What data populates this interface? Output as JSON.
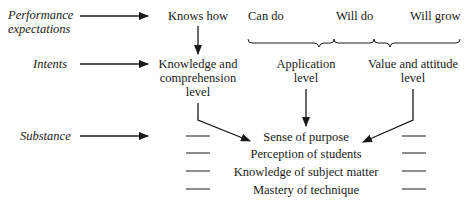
{
  "rows": {
    "performance": {
      "label_line1": "Performance",
      "label_line2": "expectations"
    },
    "intents": {
      "label": "Intents"
    },
    "substance": {
      "label": "Substance"
    }
  },
  "expectations": {
    "knows_how": "Knows how",
    "can_do": "Can do",
    "will_do": "Will do",
    "will_grow": "Will grow"
  },
  "intent_levels": {
    "knowledge": {
      "line1": "Knowledge and",
      "line2": "comprehension",
      "line3": "level"
    },
    "application": {
      "line1": "Application",
      "line2": "level"
    },
    "value": {
      "line1": "Value and attitude",
      "line2": "level"
    }
  },
  "substance_items": [
    "Sense of purpose",
    "Perception of students",
    "Knowledge of subject matter",
    "Mastery of technique"
  ]
}
